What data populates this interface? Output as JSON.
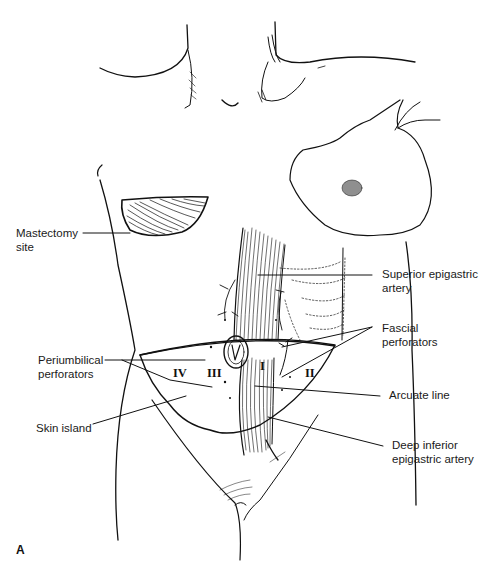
{
  "figure": {
    "panel_label": "A",
    "labels": {
      "mastectomy_site": "Mastectomy\nsite",
      "superior_epigastric_artery": "Superior epigastric\nartery",
      "fascial_perforators": "Fascial\nperforators",
      "periumbilical_perforators": "Periumbilical\nperforators",
      "arcuate_line": "Arcuate line",
      "skin_island": "Skin island",
      "deep_inferior_epigastric_artery": "Deep inferior\nepigastric artery"
    },
    "zones": [
      "IV",
      "III",
      "I",
      "II"
    ],
    "colors": {
      "line": "#111111",
      "background": "#ffffff"
    }
  }
}
